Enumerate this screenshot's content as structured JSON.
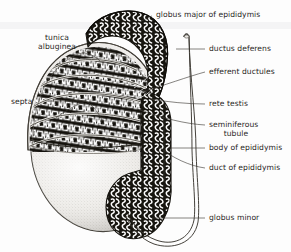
{
  "figure": {
    "style": "black-and-white engraved anatomical plate",
    "background_color": "#fdfdfd",
    "ink_color": "#17150f",
    "label_color": "#2a2725",
    "stipple_color": "#d8d6d2"
  },
  "labels": {
    "globus_major": "globus major of epididymis",
    "tunica_albuginea_line1": "tunica",
    "tunica_albuginea_line2": "albuginea",
    "septa": "septa",
    "ductus_deferens": "ductus deferens",
    "efferent_ductules": "efferent ductules",
    "rete_testis": "rete testis",
    "seminiferous_tubule_line1": "seminiferous",
    "seminiferous_tubule_line2": "tubule",
    "body_of_epididymis": "body of epididymis",
    "duct_of_epididymis": "duct of epididymis",
    "globus_minor": "globus minor"
  },
  "structures": [
    {
      "name": "globus-major-of-epididymis",
      "region": "head of epididymis, arching over superior testis"
    },
    {
      "name": "tunica-albuginea",
      "region": "fibrous capsule at anterolateral testis border"
    },
    {
      "name": "septa",
      "region": "fibrous partitions dividing testis into lobules"
    },
    {
      "name": "ductus-deferens",
      "region": "vertical duct ascending at right margin"
    },
    {
      "name": "efferent-ductules",
      "region": "ducts linking rete testis to epididymal head"
    },
    {
      "name": "rete-testis",
      "region": "network at mediastinum testis"
    },
    {
      "name": "seminiferous-tubule",
      "region": "coiled tubules filling lobules"
    },
    {
      "name": "body-of-epididymis",
      "region": "descending coiled segment at right of testis"
    },
    {
      "name": "duct-of-epididymis",
      "region": "single convoluted duct within epididymis"
    },
    {
      "name": "globus-minor",
      "region": "tail of epididymis, inferior bulb"
    }
  ]
}
